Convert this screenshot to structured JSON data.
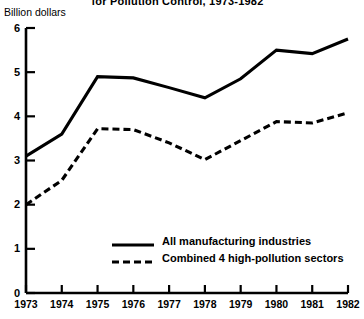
{
  "chart_data": {
    "type": "line",
    "title": "for Pollution Control, 1973-1982",
    "ylabel": "Billion dollars",
    "xlabel": "",
    "categories": [
      "1973",
      "1974",
      "1975",
      "1976",
      "1977",
      "1978",
      "1979",
      "1980",
      "1981",
      "1982"
    ],
    "ylim": [
      0,
      6
    ],
    "y_ticks": [
      "0",
      "1",
      "2",
      "3",
      "4",
      "5",
      "6"
    ],
    "grid": false,
    "legend_position": "inside-bottom-center",
    "series": [
      {
        "name": "All manufacturing industries",
        "style": "solid",
        "color": "#000000",
        "values": [
          3.1,
          3.6,
          4.9,
          4.87,
          4.65,
          4.42,
          4.85,
          5.5,
          5.42,
          5.75
        ]
      },
      {
        "name": "Combined 4 high-pollution sectors",
        "style": "dashed",
        "color": "#000000",
        "values": [
          2.0,
          2.55,
          3.72,
          3.7,
          3.4,
          3.02,
          3.45,
          3.88,
          3.85,
          4.08
        ]
      }
    ]
  }
}
